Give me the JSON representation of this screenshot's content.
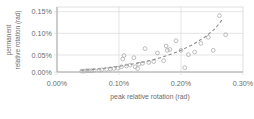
{
  "chart_data": {
    "type": "scatter",
    "title": "",
    "xlabel": "peak relative rotation (rad)",
    "ylabel_line1": "permanent",
    "ylabel_line2": "relative rotation (rad)",
    "xlim": [
      0.0,
      0.3
    ],
    "ylim": [
      0.0,
      0.15
    ],
    "xtick_labels": [
      "0.00%",
      "0.10%",
      "0.20%",
      "0.30%"
    ],
    "xtick_values": [
      0.0,
      0.1,
      0.2,
      0.3
    ],
    "ytick_labels": [
      "0.00%",
      "0.05%",
      "0.10%",
      "0.15%"
    ],
    "ytick_values": [
      0.0,
      0.05,
      0.1,
      0.15
    ],
    "grid": "horizontal-and-vertical",
    "legend": "none",
    "units": "percent",
    "marker_style": "open-circle",
    "marker_color": "#b0b0b0",
    "trend_style": "dashed",
    "trend_color": "#8c8c8c",
    "series": [
      {
        "name": "measured points",
        "points": [
          [
            0.04,
            0.002
          ],
          [
            0.044,
            0.002
          ],
          [
            0.048,
            0.003
          ],
          [
            0.052,
            0.003
          ],
          [
            0.056,
            0.003
          ],
          [
            0.06,
            0.004
          ],
          [
            0.068,
            0.004
          ],
          [
            0.072,
            0.005
          ],
          [
            0.08,
            0.006
          ],
          [
            0.086,
            0.007
          ],
          [
            0.092,
            0.008
          ],
          [
            0.098,
            0.009
          ],
          [
            0.104,
            0.012
          ],
          [
            0.106,
            0.03
          ],
          [
            0.108,
            0.038
          ],
          [
            0.112,
            0.014
          ],
          [
            0.118,
            0.016
          ],
          [
            0.124,
            0.033
          ],
          [
            0.126,
            0.012
          ],
          [
            0.13,
            0.008
          ],
          [
            0.132,
            0.018
          ],
          [
            0.138,
            0.02
          ],
          [
            0.142,
            0.054
          ],
          [
            0.148,
            0.022
          ],
          [
            0.156,
            0.024
          ],
          [
            0.162,
            0.044
          ],
          [
            0.172,
            0.026
          ],
          [
            0.176,
            0.06
          ],
          [
            0.178,
            0.05
          ],
          [
            0.182,
            0.052
          ],
          [
            0.192,
            0.072
          ],
          [
            0.2,
            0.05
          ],
          [
            0.206,
            0.01
          ],
          [
            0.212,
            0.04
          ],
          [
            0.222,
            0.046
          ],
          [
            0.232,
            0.066
          ],
          [
            0.244,
            0.08
          ],
          [
            0.252,
            0.05
          ],
          [
            0.262,
            0.13
          ],
          [
            0.272,
            0.086
          ]
        ]
      }
    ],
    "trend_curve": {
      "name": "power-law fit",
      "points": [
        [
          0.038,
          0.004
        ],
        [
          0.06,
          0.006
        ],
        [
          0.08,
          0.009
        ],
        [
          0.1,
          0.013
        ],
        [
          0.12,
          0.018
        ],
        [
          0.14,
          0.023
        ],
        [
          0.16,
          0.03
        ],
        [
          0.18,
          0.039
        ],
        [
          0.2,
          0.05
        ],
        [
          0.22,
          0.064
        ],
        [
          0.24,
          0.082
        ],
        [
          0.255,
          0.1
        ],
        [
          0.266,
          0.12
        ]
      ]
    }
  }
}
